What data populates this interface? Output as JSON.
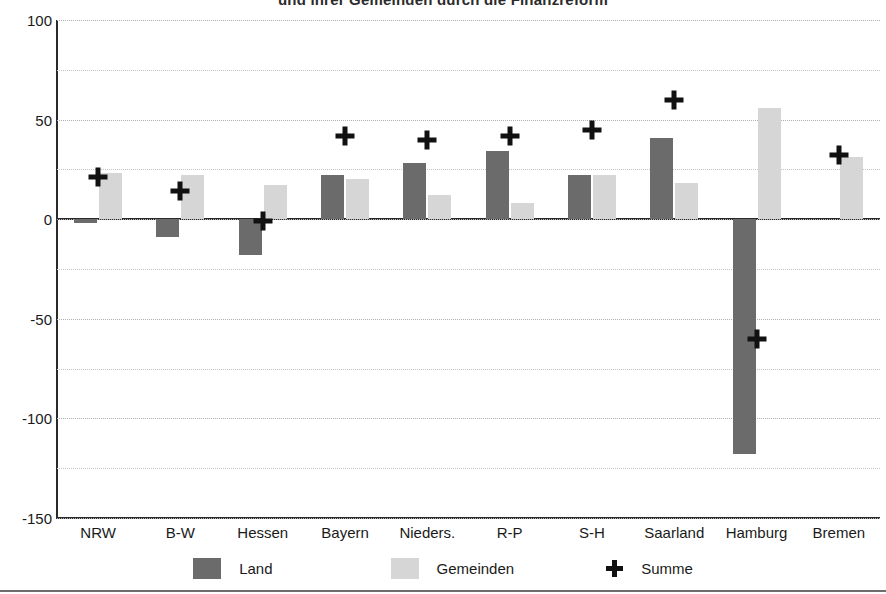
{
  "chart_data": {
    "type": "bar",
    "title": "und ihrer Gemeinden durch die Finanzreform",
    "xlabel": "",
    "ylabel": "",
    "ylim": [
      -150,
      100
    ],
    "yticks": [
      100,
      50,
      0,
      -50,
      -100,
      -150
    ],
    "ytick_labels": [
      "100",
      "50",
      "0",
      "-50",
      "-100",
      "-150"
    ],
    "minor_gridlines": [
      75,
      25,
      -25,
      -75,
      -125
    ],
    "grid": true,
    "legend_position": "bottom",
    "categories": [
      "NRW",
      "B-W",
      "Hessen",
      "Bayern",
      "Nieders.",
      "R-P",
      "S-H",
      "Saarland",
      "Hamburg",
      "Bremen"
    ],
    "series": [
      {
        "name": "Land",
        "kind": "bar",
        "color": "#6b6b6b",
        "values": [
          -2,
          -9,
          -18,
          22,
          28,
          34,
          22,
          41,
          -118,
          0
        ]
      },
      {
        "name": "Gemeinden",
        "kind": "bar",
        "color": "#d6d6d6",
        "values": [
          23,
          22,
          17,
          20,
          12,
          8,
          22,
          18,
          56,
          31
        ]
      },
      {
        "name": "Summe",
        "kind": "marker",
        "marker": "plus",
        "color": "#111111",
        "values": [
          21,
          14,
          -1,
          42,
          40,
          42,
          45,
          60,
          -60,
          32
        ]
      }
    ]
  },
  "legend": {
    "items": [
      {
        "label": "Land",
        "swatch": "dark-gray"
      },
      {
        "label": "Gemeinden",
        "swatch": "light-gray"
      },
      {
        "label": "Summe",
        "swatch": "plus-marker"
      }
    ]
  }
}
